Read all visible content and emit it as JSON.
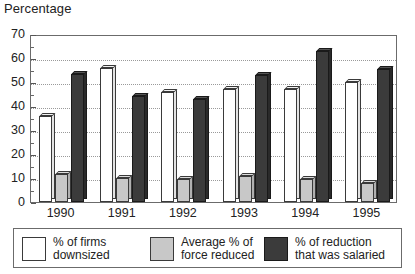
{
  "chart_data": {
    "type": "bar",
    "title": "Percentage",
    "xlabel": "",
    "ylabel": "",
    "ylim": [
      0,
      70
    ],
    "ytick_step": 10,
    "yticks": [
      0,
      10,
      20,
      30,
      40,
      50,
      60,
      70
    ],
    "ytick_labels": [
      "0",
      "10",
      "20",
      "30",
      "40",
      "50",
      "60",
      "70"
    ],
    "minor_tick_step": 5,
    "grid": true,
    "grid_style": "dotted-horizontal",
    "legend_position": "below",
    "categories": [
      "1990",
      "1991",
      "1992",
      "1993",
      "1994",
      "1995"
    ],
    "series": [
      {
        "name": "% of firms downsized",
        "color": "#ffffff",
        "values": [
          36,
          56,
          46,
          47,
          47,
          50
        ]
      },
      {
        "name": "Average % of force reduced",
        "color": "#c8c8c8",
        "values": [
          11.5,
          10,
          9.5,
          11,
          9.5,
          8
        ]
      },
      {
        "name": "% of reduction that was salaried",
        "color": "#3b3b3b",
        "values": [
          53.5,
          44,
          43,
          53,
          63,
          55.5
        ]
      }
    ]
  },
  "legend": {
    "items": [
      {
        "label": "% of firms\ndownsized",
        "swatch": "white-swatch"
      },
      {
        "label": "Average % of\nforce reduced",
        "swatch": "gray-swatch"
      },
      {
        "label": "% of reduction\nthat was salaried",
        "swatch": "dark-swatch"
      }
    ]
  }
}
